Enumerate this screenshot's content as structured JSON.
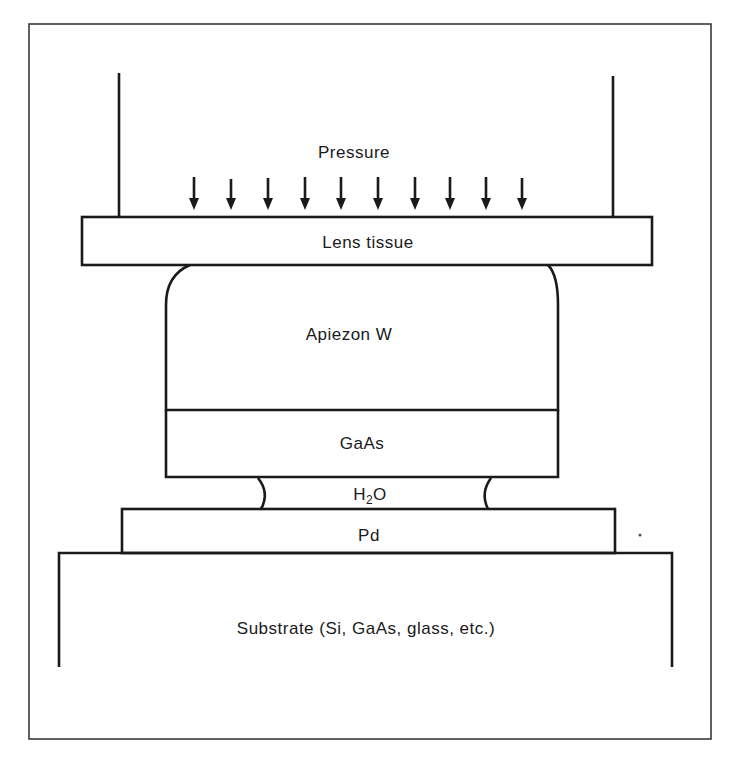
{
  "diagram": {
    "type": "layer-stack cross-section",
    "labels": {
      "pressure": "Pressure",
      "lens_tissue": "Lens tissue",
      "apiezon": "Apiezon W",
      "gaas": "GaAs",
      "water": "H",
      "water_sub": "2",
      "water_tail": "O",
      "pd": "Pd",
      "substrate": "Substrate (Si, GaAs, glass, etc.)"
    },
    "pressure_arrow_count": 10,
    "layers_top_to_bottom": [
      "Lens tissue",
      "Apiezon W",
      "GaAs",
      "H2O",
      "Pd",
      "Substrate (Si, GaAs, glass, etc.)"
    ],
    "colors": {
      "line": "#1a1a1a",
      "background": "#ffffff",
      "frame": "#3a3a3a"
    }
  }
}
